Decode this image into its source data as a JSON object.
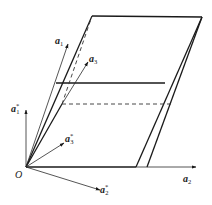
{
  "diagram": {
    "type": "crystal-lattice-unit-cell",
    "origin_label": "O",
    "direct_vectors": [
      {
        "id": "a1",
        "base": "a",
        "subscript": "1",
        "star": ""
      },
      {
        "id": "a2",
        "base": "a",
        "subscript": "2",
        "star": ""
      },
      {
        "id": "a3",
        "base": "a",
        "subscript": "3",
        "star": ""
      }
    ],
    "reciprocal_vectors": [
      {
        "id": "a1*",
        "base": "a",
        "subscript": "1",
        "star": "*"
      },
      {
        "id": "a2*",
        "base": "a",
        "subscript": "2",
        "star": "*"
      },
      {
        "id": "a3*",
        "base": "a",
        "subscript": "3",
        "star": "*"
      }
    ],
    "colors": {
      "line": "#1a1a1a",
      "background": "#ffffff"
    }
  }
}
